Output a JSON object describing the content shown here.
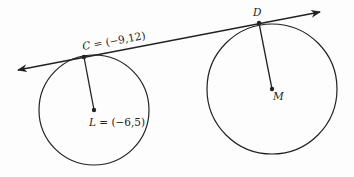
{
  "diagram": {
    "type": "geometry",
    "stroke_color": "#222222",
    "background": "#fdfdfd",
    "tangent_line": {
      "from": [
        18,
        70
      ],
      "to": [
        320,
        12
      ],
      "arrows": "both"
    },
    "circles": [
      {
        "name": "L",
        "center": [
          94,
          110
        ],
        "radius": 55,
        "label": "L = (−6,5)",
        "label_letter": "L",
        "label_coords": " = (−6,5)"
      },
      {
        "name": "M",
        "center": [
          272,
          89
        ],
        "radius": 65,
        "label": "M",
        "label_letter": "M"
      }
    ],
    "points": [
      {
        "name": "C",
        "position": [
          84,
          57
        ],
        "label": "C = (−9,12)",
        "label_letter": "C",
        "label_coords": " = (−9,12)"
      },
      {
        "name": "D",
        "position": [
          259,
          23
        ],
        "label": "D",
        "label_letter": "D"
      }
    ],
    "radii": [
      {
        "from": "L",
        "to": "C"
      },
      {
        "from": "M",
        "to": "D"
      }
    ]
  }
}
